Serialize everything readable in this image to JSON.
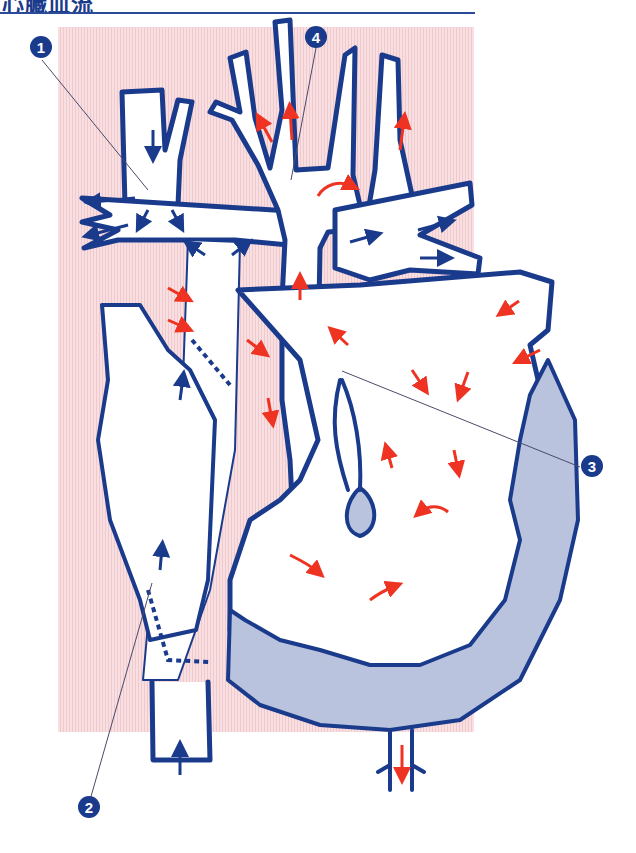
{
  "header": {
    "title": "心臓血流",
    "rule_color": "#2b4a9a"
  },
  "colors": {
    "background_tint": "#f6d9dc",
    "vessel_outline": "#1a3a8c",
    "vessel_fill": "#ffffff",
    "myocardium_fill": "#b9c3dd",
    "arterial_flow_arrow": "#ee3322",
    "venous_flow_arrow": "#1a3a8c",
    "callout_fill": "#1a3a8c",
    "callout_text": "#ffffff"
  },
  "callouts": [
    {
      "id": 1,
      "label": "1",
      "x": 30,
      "y": 47
    },
    {
      "id": 2,
      "label": "2",
      "x": 78,
      "y": 802
    },
    {
      "id": 3,
      "label": "3",
      "x": 581,
      "y": 457
    },
    {
      "id": 4,
      "label": "4",
      "x": 305,
      "y": 35
    }
  ],
  "flow_arrows": {
    "arterial_count": 20,
    "venous_count": 14
  }
}
